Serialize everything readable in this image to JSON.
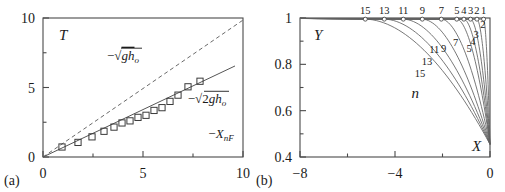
{
  "figure": {
    "caption_a": "(a)",
    "caption_b": "(b)"
  },
  "chart_data": [
    {
      "id": "panel-a",
      "type": "scatter",
      "title": "",
      "panel_label": "(a)",
      "xlabel": "",
      "ylabel": "T",
      "xlim": [
        0,
        10
      ],
      "ylim": [
        0,
        10
      ],
      "xticks": [
        0,
        5,
        10
      ],
      "xticklabels": [
        "0",
        "5",
        "10"
      ],
      "xminorticks": [
        2.5,
        7.5
      ],
      "yticks": [
        0,
        5,
        10
      ],
      "yticklabels": [
        "0",
        "5",
        "10"
      ],
      "yminorticks": [
        2.5,
        7.5
      ],
      "grid": false,
      "legend_position": "inline-annotations",
      "annotations": [
        {
          "name": "sqrt-gh0-label",
          "text": "−√(ghₒ)",
          "x": 3.6,
          "y": 7.2
        },
        {
          "name": "sqrt-2gh0-label",
          "text": "−√(2ghₒ)",
          "x": 7.6,
          "y": 4.0
        },
        {
          "name": "x-nf-label",
          "text": "−Xₙᶠ",
          "x": 8.3,
          "y": 1.4
        }
      ],
      "series": [
        {
          "name": "−√(ghₒ)",
          "style": "dashed",
          "comment": "upper reference line, slope 1",
          "x": [
            0,
            10
          ],
          "y": [
            0,
            9.85
          ]
        },
        {
          "name": "−√(2ghₒ)",
          "style": "solid",
          "comment": "lower reference line, slope ~0.707",
          "x": [
            0,
            9.6
          ],
          "y": [
            0,
            6.55
          ]
        },
        {
          "name": "−Xₙᶠ",
          "style": "markers",
          "marker": "open-square",
          "x": [
            0.95,
            1.75,
            2.45,
            3.05,
            3.55,
            3.95,
            4.35,
            4.75,
            5.15,
            5.55,
            5.95,
            6.35,
            6.75,
            7.25,
            7.85
          ],
          "y": [
            0.72,
            1.05,
            1.45,
            1.85,
            2.15,
            2.45,
            2.6,
            2.85,
            3.0,
            3.35,
            3.55,
            4.0,
            4.45,
            5.05,
            5.45
          ]
        }
      ]
    },
    {
      "id": "panel-b",
      "type": "line",
      "title": "",
      "panel_label": "(b)",
      "xlabel": "X",
      "ylabel": "Y",
      "xlim": [
        -8,
        0
      ],
      "ylim": [
        0.4,
        1.0
      ],
      "xticks": [
        -8,
        -4,
        0
      ],
      "xticklabels": [
        "−8",
        "−4",
        "0"
      ],
      "xminorticks": [
        -6,
        -2
      ],
      "yticks": [
        0.4,
        0.6,
        0.8,
        1.0
      ],
      "yticklabels": [
        "0.4",
        "0.6",
        "0.8",
        "1"
      ],
      "yminorticks": [
        0.5,
        0.7,
        0.9
      ],
      "grid": false,
      "family_parameter": "n",
      "family_parameter_label": "n",
      "legend_position": "curve-labels",
      "top_labels": [
        {
          "n": "15",
          "x": -5.25
        },
        {
          "n": "13",
          "x": -4.45
        },
        {
          "n": "11",
          "x": -3.65
        },
        {
          "n": "9",
          "x": -2.85
        },
        {
          "n": "7",
          "x": -2.05
        },
        {
          "n": "5",
          "x": -1.4
        },
        {
          "n": "4",
          "x": -1.1
        },
        {
          "n": "3",
          "x": -0.82
        },
        {
          "n": "2",
          "x": -0.55
        },
        {
          "n": "1",
          "x": -0.27
        }
      ],
      "inner_labels": [
        {
          "n": "2",
          "x": -0.3,
          "y": 0.955
        },
        {
          "n": "3",
          "x": -0.58,
          "y": 0.915
        },
        {
          "n": "4",
          "x": -0.72,
          "y": 0.885
        },
        {
          "n": "5",
          "x": -0.88,
          "y": 0.855
        },
        {
          "n": "7",
          "x": -1.45,
          "y": 0.88
        },
        {
          "n": "9",
          "x": -1.95,
          "y": 0.855
        },
        {
          "n": "11",
          "x": -2.35,
          "y": 0.85
        },
        {
          "n": "13",
          "x": -2.65,
          "y": 0.795
        },
        {
          "n": "15",
          "x": -2.95,
          "y": 0.745
        }
      ],
      "series": [
        {
          "name": "n=1",
          "n": 1,
          "marker_x": -0.27,
          "converge": [
            0,
            0.455
          ]
        },
        {
          "name": "n=2",
          "n": 2,
          "marker_x": -0.55,
          "converge": [
            0,
            0.455
          ]
        },
        {
          "name": "n=3",
          "n": 3,
          "marker_x": -0.82,
          "converge": [
            0,
            0.455
          ]
        },
        {
          "name": "n=4",
          "n": 4,
          "marker_x": -1.1,
          "converge": [
            0,
            0.455
          ]
        },
        {
          "name": "n=5",
          "n": 5,
          "marker_x": -1.4,
          "converge": [
            0,
            0.455
          ]
        },
        {
          "name": "n=7",
          "n": 7,
          "marker_x": -2.05,
          "converge": [
            0,
            0.455
          ]
        },
        {
          "name": "n=9",
          "n": 9,
          "marker_x": -2.85,
          "converge": [
            0,
            0.455
          ]
        },
        {
          "name": "n=11",
          "n": 11,
          "marker_x": -3.65,
          "converge": [
            0,
            0.455
          ]
        },
        {
          "name": "n=13",
          "n": 13,
          "marker_x": -4.45,
          "converge": [
            0,
            0.455
          ]
        },
        {
          "name": "n=15",
          "n": 15,
          "marker_x": -5.25,
          "converge": [
            0,
            0.455
          ]
        }
      ]
    }
  ]
}
